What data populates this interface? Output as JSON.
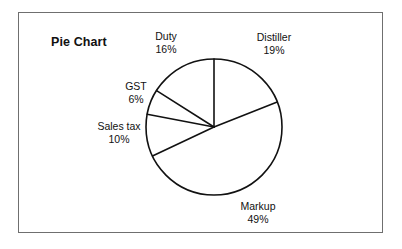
{
  "figure": {
    "title": "Pie Chart",
    "frame_color": "#6f6f6f",
    "background_color": "#ffffff",
    "stroke_color": "#111111"
  },
  "chart_data": {
    "type": "pie",
    "title": "Pie Chart",
    "xlabel": "",
    "ylabel": "",
    "grid": false,
    "legend": "none",
    "labels_position": "outside",
    "start_angle_deg": 0,
    "direction": "clockwise",
    "categories": [
      "Distiller",
      "Markup",
      "Sales tax",
      "GST",
      "Duty"
    ],
    "values": [
      19,
      49,
      10,
      6,
      16
    ],
    "unit": "%",
    "slices": [
      {
        "name": "Distiller",
        "value": 19,
        "label": "Distiller",
        "pct": "19%"
      },
      {
        "name": "Markup",
        "value": 49,
        "label": "Markup",
        "pct": "49%"
      },
      {
        "name": "Sales tax",
        "value": 10,
        "label": "Sales tax",
        "pct": "10%"
      },
      {
        "name": "GST",
        "value": 6,
        "label": "GST",
        "pct": "6%"
      },
      {
        "name": "Duty",
        "value": 16,
        "label": "Duty",
        "pct": "16%"
      }
    ]
  }
}
